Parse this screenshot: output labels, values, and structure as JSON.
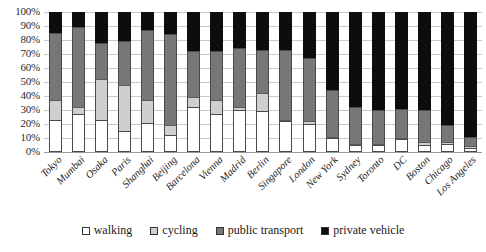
{
  "chart_data": {
    "type": "bar",
    "subtype": "stacked-percentage",
    "title": "",
    "xlabel": "",
    "ylabel": "",
    "ylim": [
      0,
      100
    ],
    "yticks": [
      "0%",
      "10%",
      "20%",
      "30%",
      "40%",
      "50%",
      "60%",
      "70%",
      "80%",
      "90%",
      "100%"
    ],
    "grid": true,
    "legend_position": "bottom",
    "categories": [
      "Tokyo",
      "Mumbai",
      "Osaka",
      "Paris",
      "Shanghai",
      "Beijing",
      "Barcelona",
      "Vienna",
      "Madrid",
      "Berlin",
      "Singapore",
      "London",
      "New York",
      "Sydney",
      "Toronto",
      "DC",
      "Boston",
      "Chicago",
      "Los Angeles"
    ],
    "series": [
      {
        "name": "walking",
        "color": "#ffffff",
        "values": [
          23,
          27,
          23,
          15,
          21,
          12,
          32,
          27,
          30,
          29,
          22,
          20,
          10,
          5,
          5,
          9,
          5,
          6,
          3
        ]
      },
      {
        "name": "cycling",
        "color": "#cfcfcf",
        "values": [
          14,
          5,
          29,
          33,
          16,
          7,
          7,
          10,
          2,
          13,
          1,
          2,
          1,
          1,
          1,
          1,
          2,
          1,
          1
        ]
      },
      {
        "name": "public transport",
        "color": "#777777",
        "values": [
          48,
          57,
          26,
          31,
          50,
          65,
          33,
          35,
          42,
          31,
          50,
          45,
          33,
          26,
          24,
          21,
          23,
          12,
          7
        ]
      },
      {
        "name": "private vehicle",
        "color": "#0d0d0d",
        "values": [
          15,
          11,
          22,
          21,
          13,
          16,
          28,
          28,
          26,
          27,
          27,
          33,
          56,
          68,
          70,
          69,
          70,
          81,
          89
        ]
      }
    ]
  },
  "legend": {
    "items": [
      {
        "label": "walking",
        "swatch": "legend-swatch-walking"
      },
      {
        "label": "cycling",
        "swatch": "legend-swatch-cycling"
      },
      {
        "label": "public transport",
        "swatch": "legend-swatch-public-transport"
      },
      {
        "label": "private vehicle",
        "swatch": "legend-swatch-private-vehicle"
      }
    ]
  }
}
